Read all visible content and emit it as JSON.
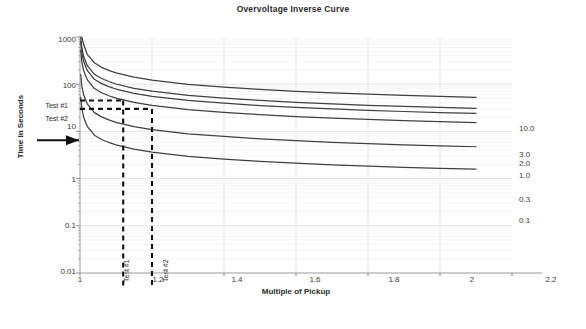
{
  "chart": {
    "title": "Overvoltage Inverse Curve",
    "xlabel": "Multiple of Pickup",
    "ylabel": "Time in Seconds"
  },
  "chart_data": {
    "type": "line",
    "title": "Overvoltage Inverse Curve",
    "xlabel": "Multiple of Pickup",
    "ylabel": "Time in Seconds",
    "xscale": "linear",
    "yscale": "log",
    "xlim": [
      1,
      2.2
    ],
    "ylim": [
      0.01,
      1000
    ],
    "grid": true,
    "legend_position": "right-of-curve-ends",
    "xticks": [
      "1",
      "1.2",
      "1.4",
      "1.6",
      "1.8",
      "2",
      "2.2"
    ],
    "xtick_values": [
      1,
      1.2,
      1.4,
      1.6,
      1.8,
      2,
      2.2
    ],
    "yticks": [
      "1000",
      "100",
      "10",
      "1",
      "0.1",
      "0.01"
    ],
    "ytick_values": [
      1000,
      100,
      10,
      1,
      0.1,
      0.01
    ],
    "series": [
      {
        "name": "10.0",
        "label": "10.0",
        "time_dial": 10.0,
        "x": [
          1.005,
          1.01,
          1.02,
          1.04,
          1.06,
          1.08,
          1.1,
          1.15,
          1.2,
          1.3,
          1.4,
          1.5,
          1.6,
          1.7,
          1.8,
          1.9,
          2.0,
          2.1
        ],
        "y": [
          1000,
          700,
          430,
          285,
          228,
          196,
          174,
          141,
          122,
          99.5,
          86.5,
          77.5,
          70.8,
          65.6,
          61.4,
          58.0,
          55.1,
          52.6
        ]
      },
      {
        "name": "3.0",
        "label": "3.0",
        "time_dial": 3.0,
        "x": [
          1.002,
          1.005,
          1.01,
          1.02,
          1.04,
          1.06,
          1.08,
          1.1,
          1.15,
          1.2,
          1.3,
          1.4,
          1.5,
          1.6,
          1.7,
          1.8,
          1.9,
          2.0,
          2.1
        ],
        "y": [
          1000,
          600,
          390,
          250,
          162,
          132,
          114,
          101,
          82,
          71,
          58,
          50.5,
          45.2,
          41.3,
          38.3,
          35.8,
          33.8,
          32.1,
          30.7
        ]
      },
      {
        "name": "2.0",
        "label": "2.0",
        "time_dial": 2.0,
        "x": [
          1.002,
          1.005,
          1.01,
          1.02,
          1.04,
          1.06,
          1.08,
          1.1,
          1.15,
          1.2,
          1.3,
          1.4,
          1.5,
          1.6,
          1.7,
          1.8,
          1.9,
          2.0,
          2.1
        ],
        "y": [
          800,
          470,
          305,
          196,
          127,
          103,
          89,
          79,
          64,
          55.5,
          45.3,
          39.5,
          35.3,
          32.3,
          29.9,
          28.0,
          26.4,
          25.1,
          24.0
        ]
      },
      {
        "name": "1.0",
        "label": "1.0",
        "time_dial": 1.0,
        "x": [
          1.002,
          1.005,
          1.01,
          1.02,
          1.04,
          1.06,
          1.08,
          1.1,
          1.15,
          1.2,
          1.3,
          1.4,
          1.5,
          1.6,
          1.7,
          1.8,
          1.9,
          2.0,
          2.1
        ],
        "y": [
          520,
          300,
          195,
          125,
          81,
          66,
          57,
          50.5,
          41,
          35.5,
          29,
          25.3,
          22.6,
          20.6,
          19.1,
          17.9,
          16.9,
          16.1,
          15.4
        ]
      },
      {
        "name": "0.3",
        "label": "0.3",
        "time_dial": 0.3,
        "x": [
          1.002,
          1.005,
          1.01,
          1.02,
          1.04,
          1.06,
          1.08,
          1.1,
          1.15,
          1.2,
          1.3,
          1.4,
          1.5,
          1.6,
          1.7,
          1.8,
          1.9,
          2.0,
          2.1
        ],
        "y": [
          160,
          92,
          60,
          38.5,
          25,
          20.3,
          17.5,
          15.5,
          12.6,
          10.9,
          8.9,
          7.8,
          6.95,
          6.35,
          5.88,
          5.5,
          5.2,
          4.95,
          4.73
        ]
      },
      {
        "name": "0.1",
        "label": "0.1",
        "time_dial": 0.1,
        "x": [
          1.002,
          1.005,
          1.01,
          1.02,
          1.04,
          1.06,
          1.08,
          1.1,
          1.15,
          1.2,
          1.3,
          1.4,
          1.5,
          1.6,
          1.7,
          1.8,
          1.9,
          2.0,
          2.1
        ],
        "y": [
          53,
          31,
          20,
          12.8,
          8.3,
          6.75,
          5.83,
          5.17,
          4.2,
          3.63,
          2.97,
          2.59,
          2.32,
          2.12,
          1.96,
          1.83,
          1.73,
          1.65,
          1.58
        ]
      }
    ],
    "annotations": [
      {
        "name": "Test #1",
        "ylabel": "Test #1",
        "xlabel": "Test #1",
        "x": 1.12,
        "y": 45
      },
      {
        "name": "Test #2",
        "ylabel": "Test #2",
        "xlabel": "Test #2",
        "x": 1.2,
        "y": 30
      },
      {
        "name": "pickup-arrow",
        "ylabel": "",
        "xlabel": "",
        "x": 1.0,
        "y": 6.5
      }
    ]
  },
  "series_labels": {
    "s0": "10.0",
    "s1": "3.0",
    "s2": "2.0",
    "s3": "1.0",
    "s4": "0.3",
    "s5": "0.1"
  },
  "yticks": {
    "t0": "1000",
    "t1": "100",
    "t2": "10",
    "t3": "1",
    "t4": "0.1",
    "t5": "0.01"
  },
  "xticks": {
    "t0": "1",
    "t1": "1.2",
    "t2": "1.4",
    "t3": "1.6",
    "t4": "1.8",
    "t5": "2",
    "t6": "2.2"
  },
  "annotations": {
    "test1_y": "Test #1",
    "test2_y": "Test #2",
    "test1_x": "Test #1",
    "test2_x": "Test #2"
  },
  "colors": {
    "curve": "#404040",
    "grid": "#e3e3e8",
    "axis": "#9a9a9a",
    "text": "#333333",
    "annotation": "#111111"
  }
}
